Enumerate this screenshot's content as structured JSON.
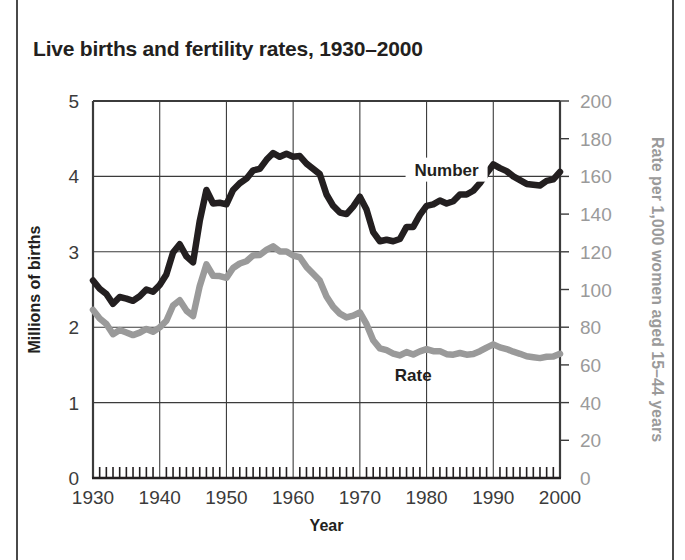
{
  "figure": {
    "title": "Live births and fertility rates, 1930–2000",
    "border_color": "#4a4a4a",
    "background": "#ffffff"
  },
  "chart_data": {
    "type": "line",
    "title": "Live births and fertility rates, 1930–2000",
    "xlabel": "Year",
    "ylabel": "Millions of births",
    "y2label": "Rate per 1,000 women aged 15–44 years",
    "xlim": [
      1930,
      2000
    ],
    "ylim": [
      0,
      5
    ],
    "y2lim": [
      0,
      200
    ],
    "grid": true,
    "legend_position": "inline-annotation",
    "xticks": [
      1930,
      1940,
      1950,
      1960,
      1970,
      1980,
      1990,
      2000
    ],
    "xtick_labels": [
      "1930",
      "1940",
      "1950",
      "1960",
      "1970",
      "1980",
      "1990",
      "2000"
    ],
    "xminor_tick_interval": 1,
    "yticks": [
      0,
      1,
      2,
      3,
      4,
      5
    ],
    "ytick_labels": [
      "0",
      "1",
      "2",
      "3",
      "4",
      "5"
    ],
    "y2ticks": [
      0,
      20,
      40,
      60,
      80,
      100,
      120,
      140,
      160,
      180,
      200
    ],
    "y2tick_labels": [
      "0",
      "20",
      "40",
      "60",
      "80",
      "100",
      "120",
      "140",
      "160",
      "180",
      "200"
    ],
    "x": [
      1930,
      1931,
      1932,
      1933,
      1934,
      1935,
      1936,
      1937,
      1938,
      1939,
      1940,
      1941,
      1942,
      1943,
      1944,
      1945,
      1946,
      1947,
      1948,
      1949,
      1950,
      1951,
      1952,
      1953,
      1954,
      1955,
      1956,
      1957,
      1958,
      1959,
      1960,
      1961,
      1962,
      1963,
      1964,
      1965,
      1966,
      1967,
      1968,
      1969,
      1970,
      1971,
      1972,
      1973,
      1974,
      1975,
      1976,
      1977,
      1978,
      1979,
      1980,
      1981,
      1982,
      1983,
      1984,
      1985,
      1986,
      1987,
      1988,
      1989,
      1990,
      1991,
      1992,
      1993,
      1994,
      1995,
      1996,
      1997,
      1998,
      1999,
      2000
    ],
    "series": [
      {
        "name": "Number",
        "label": "Number",
        "color": "#231f20",
        "axis": "left",
        "units": "millions of births",
        "label_x": 1983,
        "label_y": 4.05,
        "values": [
          2.62,
          2.51,
          2.44,
          2.31,
          2.4,
          2.38,
          2.35,
          2.41,
          2.5,
          2.47,
          2.56,
          2.7,
          2.99,
          3.1,
          2.94,
          2.86,
          3.41,
          3.82,
          3.64,
          3.65,
          3.63,
          3.82,
          3.91,
          3.97,
          4.08,
          4.1,
          4.22,
          4.31,
          4.26,
          4.3,
          4.26,
          4.27,
          4.17,
          4.1,
          4.03,
          3.76,
          3.61,
          3.52,
          3.5,
          3.6,
          3.73,
          3.56,
          3.26,
          3.14,
          3.16,
          3.14,
          3.17,
          3.33,
          3.33,
          3.49,
          3.61,
          3.63,
          3.68,
          3.64,
          3.67,
          3.76,
          3.76,
          3.81,
          3.91,
          4.04,
          4.16,
          4.11,
          4.07,
          4.0,
          3.95,
          3.9,
          3.89,
          3.88,
          3.94,
          3.96,
          4.06
        ]
      },
      {
        "name": "Rate",
        "label": "Rate",
        "color": "#9a9a9a",
        "axis": "right",
        "units": "per 1,000 women aged 15-44 years",
        "label_x": 1978,
        "label_y": 53,
        "values": [
          89.2,
          84.6,
          81.7,
          76.3,
          78.5,
          77.2,
          75.8,
          77.1,
          79.1,
          77.6,
          79.9,
          83.4,
          91.5,
          94.3,
          88.8,
          85.9,
          101.9,
          113.3,
          107.3,
          107.1,
          106.2,
          111.4,
          113.8,
          115.0,
          118.1,
          118.3,
          121.0,
          122.9,
          120.2,
          120.2,
          118.0,
          117.1,
          112.0,
          108.3,
          104.7,
          96.3,
          90.8,
          87.2,
          85.2,
          86.1,
          87.9,
          81.6,
          73.1,
          68.8,
          67.8,
          66.0,
          65.0,
          66.8,
          65.5,
          67.2,
          68.4,
          67.3,
          67.3,
          65.7,
          65.4,
          66.3,
          65.4,
          65.8,
          67.3,
          69.2,
          70.9,
          69.3,
          68.4,
          67.0,
          65.9,
          64.6,
          64.1,
          63.6,
          64.3,
          64.4,
          65.9
        ]
      }
    ]
  }
}
